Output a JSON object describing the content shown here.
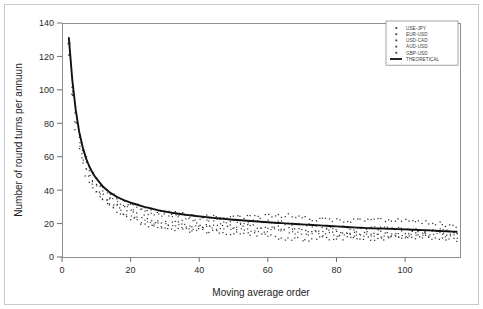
{
  "figure": {
    "background_color": "#ffffff",
    "frame_color": "#8d8d8d",
    "theoretical_color": "#111111"
  },
  "chart_data": {
    "type": "scatter",
    "title": "",
    "xlabel": "Moving average order",
    "ylabel": "Number of round turns per annuun",
    "xlim": [
      0,
      116
    ],
    "ylim": [
      0,
      140
    ],
    "xticks": [
      0,
      20,
      40,
      60,
      80,
      100
    ],
    "yticks": [
      0,
      20,
      40,
      60,
      80,
      100,
      120,
      140
    ],
    "xticklabels": [
      "0",
      "20",
      "40",
      "60",
      "80",
      "100"
    ],
    "yticklabels": [
      "0",
      "20",
      "40",
      "60",
      "80",
      "100",
      "120",
      "140"
    ],
    "grid": false,
    "legend_position": "upper right",
    "legend_entries": [
      {
        "label": "USE-JPY",
        "marker": "dot",
        "color": "#3d3d3d"
      },
      {
        "label": "EUR-USD",
        "marker": "dot",
        "color": "#3d3d3d"
      },
      {
        "label": "USD-CAD",
        "marker": "dot",
        "color": "#3d3d3d"
      },
      {
        "label": "AUD-USD",
        "marker": "dot",
        "color": "#3d3d3d"
      },
      {
        "label": "GBP-USD",
        "marker": "dot",
        "color": "#3d3d3d"
      },
      {
        "label": "THEORETICAL",
        "marker": "line",
        "color": "#111111"
      }
    ],
    "series": [
      {
        "name": "THEORETICAL",
        "type": "line",
        "x": [
          2,
          3,
          4,
          5,
          6,
          7,
          8,
          9,
          10,
          12,
          14,
          16,
          18,
          20,
          24,
          28,
          32,
          36,
          40,
          45,
          50,
          55,
          60,
          65,
          70,
          75,
          80,
          85,
          90,
          95,
          100,
          105,
          110,
          115
        ],
        "y": [
          131,
          106,
          88,
          75,
          66,
          59,
          54,
          50,
          47,
          42,
          38.5,
          36,
          34,
          32.5,
          30,
          28,
          26.5,
          25.3,
          24.3,
          23.2,
          22.3,
          21.5,
          20.8,
          20.1,
          19.5,
          18.9,
          18.3,
          17.7,
          17.2,
          16.9,
          16.5,
          16.1,
          15.6,
          15.1
        ]
      },
      {
        "name": "USE-JPY",
        "type": "scatter",
        "x": [
          2,
          3,
          4,
          5,
          6,
          7,
          8,
          9,
          10,
          12,
          14,
          16,
          18,
          20,
          24,
          28,
          32,
          36,
          40,
          45,
          50,
          55,
          60,
          65,
          70,
          75,
          80,
          85,
          90,
          95,
          100,
          105,
          110,
          115
        ],
        "y": [
          130,
          104,
          86,
          73,
          65,
          58,
          53,
          49,
          46,
          41,
          38,
          35.5,
          33.5,
          32,
          29.5,
          27,
          26,
          25,
          24.5,
          24,
          24.5,
          24,
          24.5,
          25,
          23.5,
          22.5,
          22,
          22,
          22,
          22.5,
          22,
          21,
          20,
          18
        ]
      },
      {
        "name": "EUR-USD",
        "type": "scatter",
        "x": [
          2,
          3,
          4,
          5,
          6,
          7,
          8,
          9,
          10,
          12,
          14,
          16,
          18,
          20,
          24,
          28,
          32,
          36,
          40,
          45,
          50,
          55,
          60,
          65,
          70,
          75,
          80,
          85,
          90,
          95,
          100,
          105,
          110,
          115
        ],
        "y": [
          126,
          100,
          83,
          70,
          62,
          56,
          51,
          47,
          44,
          39,
          36,
          34,
          32,
          30.5,
          27,
          25,
          24,
          23,
          22.5,
          22,
          21.5,
          21,
          21,
          20.5,
          19,
          18,
          17.5,
          17,
          17,
          17,
          16.5,
          16,
          16,
          15
        ]
      },
      {
        "name": "USD-CAD",
        "type": "scatter",
        "x": [
          2,
          3,
          4,
          5,
          6,
          7,
          8,
          9,
          10,
          12,
          14,
          16,
          18,
          20,
          24,
          28,
          32,
          36,
          40,
          45,
          50,
          55,
          60,
          65,
          70,
          75,
          80,
          85,
          90,
          95,
          100,
          105,
          110,
          115
        ],
        "y": [
          124,
          98,
          81,
          69,
          60,
          54,
          49,
          45,
          42,
          37,
          34,
          31,
          29,
          27,
          24,
          21,
          20,
          19.5,
          19,
          19,
          18.5,
          18.5,
          18,
          17.5,
          16.5,
          16,
          15.5,
          15,
          14.5,
          14.5,
          14.5,
          14.5,
          14.5,
          14
        ]
      },
      {
        "name": "AUD-USD",
        "type": "scatter",
        "x": [
          2,
          3,
          4,
          5,
          6,
          7,
          8,
          9,
          10,
          12,
          14,
          16,
          18,
          20,
          24,
          28,
          32,
          36,
          40,
          45,
          50,
          55,
          60,
          65,
          70,
          75,
          80,
          85,
          90,
          95,
          100,
          105,
          110,
          115
        ],
        "y": [
          122,
          96,
          79,
          66,
          58,
          52,
          47,
          43,
          40,
          35,
          32,
          29.5,
          27,
          25,
          21,
          19,
          18.5,
          18,
          18,
          17.5,
          17,
          16.5,
          16,
          15.5,
          14.5,
          14,
          13.5,
          13,
          12.5,
          12.5,
          13,
          13.5,
          13.5,
          12
        ]
      },
      {
        "name": "GBP-USD",
        "type": "scatter",
        "x": [
          2,
          3,
          4,
          5,
          6,
          7,
          8,
          9,
          10,
          12,
          14,
          16,
          18,
          20,
          24,
          28,
          32,
          36,
          40,
          45,
          50,
          55,
          60,
          65,
          70,
          75,
          80,
          85,
          90,
          95,
          100,
          105,
          110,
          115
        ],
        "y": [
          120,
          94,
          77,
          64,
          56,
          50,
          45,
          41,
          38,
          33,
          30,
          27.5,
          25,
          23,
          19,
          17.5,
          17,
          16.5,
          16,
          15,
          14.5,
          14,
          12.5,
          11,
          10.5,
          11,
          11.5,
          11.5,
          11,
          11.5,
          12,
          12,
          11.5,
          10
        ]
      }
    ]
  }
}
